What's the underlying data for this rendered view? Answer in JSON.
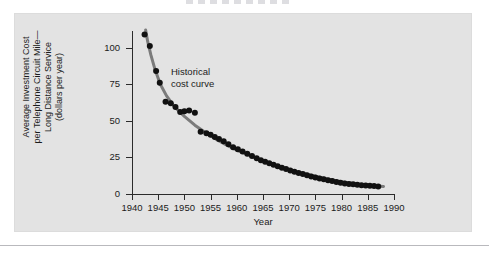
{
  "figure": {
    "caption_remnant": "",
    "panel_bg": "#e3e3e3",
    "page_bg": "#ffffff"
  },
  "chart_data": {
    "type": "scatter",
    "title": "",
    "xlabel": "Year",
    "ylabel": "Average Investment Cost\nper Telephone Circuit Mile—\nLong Distance Service\n(dollars per year)",
    "xlim": [
      1940,
      1990
    ],
    "ylim": [
      0,
      112
    ],
    "xticks": [
      1940,
      1945,
      1950,
      1955,
      1960,
      1965,
      1970,
      1975,
      1980,
      1985,
      1990
    ],
    "xtick_labels": [
      "1940",
      "1945",
      "1950",
      "1955",
      "1960",
      "1965",
      "1970",
      "1975",
      "1980",
      "1985",
      "1990"
    ],
    "yticks": [
      0,
      25,
      50,
      75,
      100
    ],
    "ytick_labels": [
      "0",
      "25",
      "50",
      "75",
      "100"
    ],
    "grid": false,
    "legend_position": "none",
    "annotations": [
      {
        "text": "Historical\ncost curve",
        "x": 1948.5,
        "y": 88,
        "color": "#1b1b1b"
      }
    ],
    "series": [
      {
        "name": "Observed cost per circuit mile",
        "marker": "filled-circle",
        "color": "#111111",
        "marker_size": 3,
        "points": [
          {
            "x": 1942.4,
            "y": 109.0
          },
          {
            "x": 1943.4,
            "y": 101.0
          },
          {
            "x": 1944.6,
            "y": 84.0
          },
          {
            "x": 1945.3,
            "y": 76.0
          },
          {
            "x": 1946.4,
            "y": 63.0
          },
          {
            "x": 1947.4,
            "y": 62.0
          },
          {
            "x": 1948.3,
            "y": 59.5
          },
          {
            "x": 1949.2,
            "y": 56.0
          },
          {
            "x": 1950.0,
            "y": 56.5
          },
          {
            "x": 1950.9,
            "y": 57.0
          },
          {
            "x": 1952.0,
            "y": 55.5
          },
          {
            "x": 1953.1,
            "y": 42.5
          },
          {
            "x": 1954.2,
            "y": 41.5
          },
          {
            "x": 1955.0,
            "y": 40.5
          },
          {
            "x": 1955.8,
            "y": 39.0
          },
          {
            "x": 1956.6,
            "y": 37.5
          },
          {
            "x": 1957.5,
            "y": 36.0
          },
          {
            "x": 1958.4,
            "y": 34.0
          },
          {
            "x": 1959.3,
            "y": 32.0
          },
          {
            "x": 1960.2,
            "y": 30.5
          },
          {
            "x": 1961.1,
            "y": 29.0
          },
          {
            "x": 1962.0,
            "y": 27.5
          },
          {
            "x": 1962.9,
            "y": 26.0
          },
          {
            "x": 1963.8,
            "y": 24.5
          },
          {
            "x": 1964.6,
            "y": 23.0
          },
          {
            "x": 1965.4,
            "y": 22.0
          },
          {
            "x": 1966.2,
            "y": 21.0
          },
          {
            "x": 1967.0,
            "y": 20.0
          },
          {
            "x": 1967.8,
            "y": 19.0
          },
          {
            "x": 1968.6,
            "y": 18.0
          },
          {
            "x": 1969.4,
            "y": 17.0
          },
          {
            "x": 1970.2,
            "y": 16.0
          },
          {
            "x": 1971.0,
            "y": 15.2
          },
          {
            "x": 1971.8,
            "y": 14.4
          },
          {
            "x": 1972.6,
            "y": 13.6
          },
          {
            "x": 1973.4,
            "y": 12.8
          },
          {
            "x": 1974.2,
            "y": 12.0
          },
          {
            "x": 1975.0,
            "y": 11.3
          },
          {
            "x": 1975.8,
            "y": 10.6
          },
          {
            "x": 1976.6,
            "y": 10.0
          },
          {
            "x": 1977.4,
            "y": 9.4
          },
          {
            "x": 1978.2,
            "y": 8.8
          },
          {
            "x": 1979.0,
            "y": 8.2
          },
          {
            "x": 1979.8,
            "y": 7.6
          },
          {
            "x": 1980.6,
            "y": 7.2
          },
          {
            "x": 1981.4,
            "y": 6.9
          },
          {
            "x": 1982.2,
            "y": 6.6
          },
          {
            "x": 1983.0,
            "y": 6.3
          },
          {
            "x": 1983.8,
            "y": 6.0
          },
          {
            "x": 1984.6,
            "y": 5.8
          },
          {
            "x": 1985.4,
            "y": 5.6
          },
          {
            "x": 1986.2,
            "y": 5.4
          },
          {
            "x": 1987.0,
            "y": 5.2
          }
        ]
      },
      {
        "name": "Historical cost curve",
        "marker": "none",
        "line": "solid",
        "color": "#7b7b7b",
        "line_width": 3,
        "points": [
          {
            "x": 1942.6,
            "y": 112.0
          },
          {
            "x": 1943.0,
            "y": 104.0
          },
          {
            "x": 1943.6,
            "y": 95.0
          },
          {
            "x": 1944.4,
            "y": 85.0
          },
          {
            "x": 1945.4,
            "y": 75.0
          },
          {
            "x": 1946.6,
            "y": 67.0
          },
          {
            "x": 1948.0,
            "y": 60.0
          },
          {
            "x": 1950.0,
            "y": 53.0
          },
          {
            "x": 1952.0,
            "y": 47.0
          },
          {
            "x": 1954.0,
            "y": 42.0
          },
          {
            "x": 1956.0,
            "y": 37.5
          },
          {
            "x": 1958.0,
            "y": 33.5
          },
          {
            "x": 1960.0,
            "y": 30.0
          },
          {
            "x": 1962.0,
            "y": 27.0
          },
          {
            "x": 1964.0,
            "y": 24.0
          },
          {
            "x": 1966.0,
            "y": 21.5
          },
          {
            "x": 1968.0,
            "y": 19.0
          },
          {
            "x": 1970.0,
            "y": 16.8
          },
          {
            "x": 1972.0,
            "y": 14.8
          },
          {
            "x": 1974.0,
            "y": 13.0
          },
          {
            "x": 1976.0,
            "y": 11.3
          },
          {
            "x": 1978.0,
            "y": 9.8
          },
          {
            "x": 1980.0,
            "y": 8.4
          },
          {
            "x": 1982.0,
            "y": 7.3
          },
          {
            "x": 1984.0,
            "y": 6.4
          },
          {
            "x": 1986.0,
            "y": 5.7
          },
          {
            "x": 1988.0,
            "y": 5.2
          }
        ]
      }
    ]
  }
}
